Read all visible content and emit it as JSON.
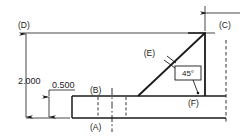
{
  "drawing": {
    "title": "Datum feature profile with 45 degree basic angle",
    "background_color": "#ffffff",
    "line_color": "#1a1a1a",
    "dimensions": [
      {
        "id": "height",
        "value": "2.000",
        "orientation": "vertical"
      },
      {
        "id": "thickness",
        "value": "0.500",
        "orientation": "vertical"
      }
    ],
    "angle": {
      "value": "45°",
      "boxed": true
    },
    "datums": [
      {
        "id": "A",
        "label": "(A)",
        "position": "below-base-slab"
      },
      {
        "id": "B",
        "label": "(B)",
        "position": "above-base-slab-top"
      },
      {
        "id": "C",
        "label": "(C)",
        "position": "top-right"
      },
      {
        "id": "D",
        "label": "(D)",
        "position": "top-left"
      },
      {
        "id": "E",
        "label": "(E)",
        "position": "on-incline"
      },
      {
        "id": "F",
        "label": "(F)",
        "position": "lower-right"
      }
    ]
  }
}
